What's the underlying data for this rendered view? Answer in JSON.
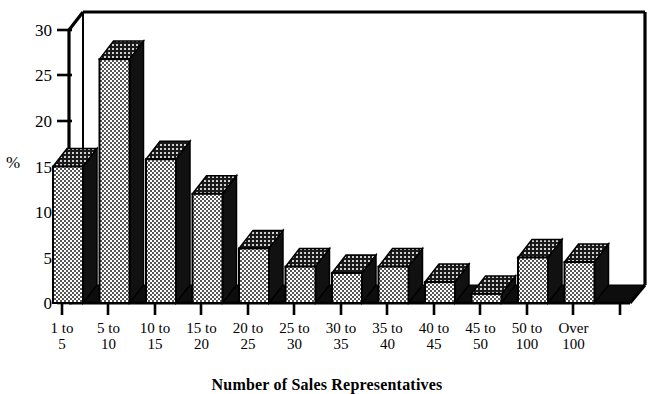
{
  "chart_data": {
    "type": "bar",
    "title": "",
    "xlabel": "Number of Sales Representatives",
    "ylabel": "%",
    "categories": [
      "1 to 5",
      "5 to 10",
      "10 to 15",
      "15 to 20",
      "20 to 25",
      "25 to 30",
      "30 to 35",
      "35 to 40",
      "40 to 45",
      "45 to 50",
      "50 to 100",
      "Over 100"
    ],
    "category_lines": [
      {
        "line1": "1 to",
        "line2": "5"
      },
      {
        "line1": "5 to",
        "line2": "10"
      },
      {
        "line1": "10 to",
        "line2": "15"
      },
      {
        "line1": "15 to",
        "line2": "20"
      },
      {
        "line1": "20 to",
        "line2": "25"
      },
      {
        "line1": "25 to",
        "line2": "30"
      },
      {
        "line1": "30 to",
        "line2": "35"
      },
      {
        "line1": "35 to",
        "line2": "40"
      },
      {
        "line1": "40 to",
        "line2": "45"
      },
      {
        "line1": "45 to",
        "line2": "50"
      },
      {
        "line1": "50 to",
        "line2": "100"
      },
      {
        "line1": "Over",
        "line2": "100"
      }
    ],
    "values": [
      15,
      26.8,
      15.8,
      12,
      6,
      4,
      3.3,
      4,
      2.3,
      1,
      5,
      4.5
    ],
    "ylim": [
      0,
      30
    ],
    "yticks": [
      0,
      5,
      10,
      15,
      20,
      25,
      30
    ],
    "ytick_labels": [
      "0",
      "5",
      "10",
      "15",
      "20",
      "25",
      "30"
    ],
    "grid": false,
    "legend": "none",
    "style": "3d-bar",
    "colors": {
      "bar_fill": "#808080",
      "bar_shadow": "#111111",
      "axis": "#000000",
      "background": "#ffffff"
    }
  }
}
